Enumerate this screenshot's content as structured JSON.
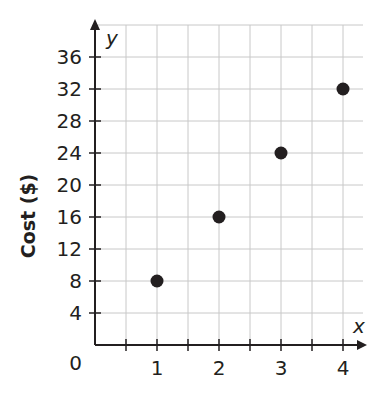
{
  "chart_data": {
    "type": "scatter",
    "title": "",
    "xlabel": "x",
    "ylabel": "Cost ($)",
    "y_axis_var": "y",
    "x": [
      1,
      2,
      3,
      4
    ],
    "y": [
      8,
      16,
      24,
      32
    ],
    "xlim": [
      0,
      4.5
    ],
    "ylim": [
      0,
      40
    ],
    "x_ticks": [
      "1",
      "2",
      "3",
      "4"
    ],
    "y_ticks": [
      "4",
      "8",
      "12",
      "16",
      "20",
      "24",
      "28",
      "32",
      "36"
    ],
    "origin_label": "0",
    "grid": true,
    "legend": null
  },
  "colors": {
    "point": "#231f20",
    "axis": "#231f20",
    "grid": "#c8c8c8"
  }
}
